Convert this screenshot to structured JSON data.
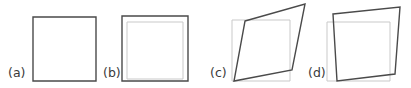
{
  "figure": {
    "width": 411,
    "height": 88,
    "background_color": "#ffffff",
    "shape_stroke_color": "#4a4a4a",
    "reference_stroke_color": "#c9c9c9",
    "label_color": "#3a3a3a",
    "panel_count": 4
  },
  "panels": [
    {
      "id": "a",
      "label": "(a)",
      "shape_name": "square",
      "has_reference_square": false,
      "shape_points": "33,17 96,17 96,81 33,81",
      "reference_points": ""
    },
    {
      "id": "b",
      "label": "(b)",
      "shape_name": "translated-square",
      "has_reference_square": true,
      "shape_points": "19,16 85,16 85,81 19,81",
      "reference_points": "24,22 80,22 80,79 24,79"
    },
    {
      "id": "c",
      "label": "(c)",
      "shape_name": "sheared-parallelogram",
      "has_reference_square": true,
      "shape_points": "42,21 102,4 89,70 31,81",
      "reference_points": "29,20 87,20 87,81 29,81"
    },
    {
      "id": "d",
      "label": "(d)",
      "shape_name": "rotated-quadrilateral",
      "has_reference_square": true,
      "shape_points": "26,14 93,7 88,74 30,81",
      "reference_points": "20,22 83,22 83,81 20,81"
    }
  ]
}
